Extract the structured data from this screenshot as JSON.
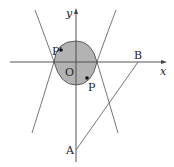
{
  "diagram": {
    "colors": {
      "stroke": "#555555",
      "axis": "#444444",
      "shade": "#b3b3b3",
      "point": "#111111",
      "text": "#222222"
    },
    "labels": {
      "y_axis": "y",
      "x_axis": "x",
      "origin": "O",
      "point_p": "P",
      "point_p_prime": "P′",
      "point_a": "A",
      "point_b": "B"
    }
  }
}
